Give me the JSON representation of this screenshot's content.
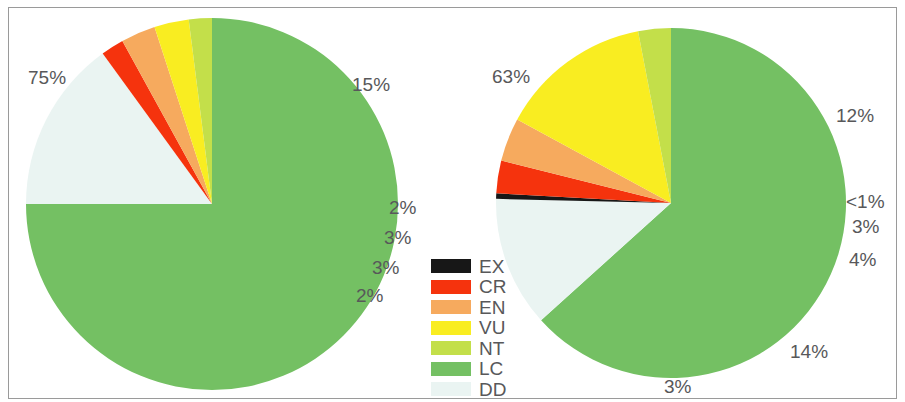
{
  "figure": {
    "background_color": "#ffffff",
    "frame_color": "#9a9a9a",
    "label_color": "#58585a"
  },
  "legend": {
    "name": "iucn-red-list-categories",
    "items": [
      {
        "code": "EX",
        "color": "#171717"
      },
      {
        "code": "CR",
        "color": "#f5330d"
      },
      {
        "code": "EN",
        "color": "#f6aa5e"
      },
      {
        "code": "VU",
        "color": "#f9ed21"
      },
      {
        "code": "NT",
        "color": "#c3df4a"
      },
      {
        "code": "LC",
        "color": "#74c063"
      },
      {
        "code": "DD",
        "color": "#eaf4f2"
      }
    ]
  },
  "chart_data": [
    {
      "type": "pie",
      "name": "left-pie",
      "title": "",
      "categories": [
        "LC",
        "DD",
        "EX",
        "CR",
        "EN",
        "VU",
        "NT"
      ],
      "labels": [
        "75%",
        "15%",
        "",
        "2%",
        "3%",
        "3%",
        "2%"
      ],
      "values": [
        75,
        15,
        0,
        2,
        3,
        3,
        2
      ],
      "colors": [
        "#74c063",
        "#eaf4f2",
        "#171717",
        "#f5330d",
        "#f6aa5e",
        "#f9ed21",
        "#c3df4a"
      ],
      "legend_position": "center-between-charts",
      "start_angle_deg": -90,
      "exploded": false
    },
    {
      "type": "pie",
      "name": "right-pie",
      "title": "",
      "categories": [
        "LC",
        "DD",
        "EX",
        "CR",
        "EN",
        "VU",
        "NT"
      ],
      "labels": [
        "63%",
        "12%",
        "<1%",
        "3%",
        "4%",
        "14%",
        "3%"
      ],
      "values": [
        63,
        12,
        0.5,
        3,
        4,
        14,
        3
      ],
      "colors": [
        "#74c063",
        "#eaf4f2",
        "#171717",
        "#f5330d",
        "#f6aa5e",
        "#f9ed21",
        "#c3df4a"
      ],
      "legend_position": "center-between-charts",
      "start_angle_deg": -90,
      "exploded": false
    }
  ],
  "left_chart": {
    "center_x": 212,
    "center_y": 204,
    "radius": 186,
    "labels": {
      "lc": {
        "text": "75%",
        "x": 28,
        "y": 67
      },
      "dd": {
        "text": "15%",
        "x": 352,
        "y": 74
      },
      "cr": {
        "text": "2%",
        "x": 389,
        "y": 197
      },
      "en": {
        "text": "3%",
        "x": 384,
        "y": 227
      },
      "vu": {
        "text": "3%",
        "x": 372,
        "y": 257
      },
      "nt": {
        "text": "2%",
        "x": 356,
        "y": 285
      }
    }
  },
  "right_chart": {
    "center_x": 671,
    "center_y": 203,
    "radius": 175,
    "labels": {
      "lc": {
        "text": "63%",
        "x": 492,
        "y": 66
      },
      "dd": {
        "text": "12%",
        "x": 836,
        "y": 105
      },
      "ex": {
        "text": "<1%",
        "x": 846,
        "y": 191
      },
      "cr": {
        "text": "3%",
        "x": 852,
        "y": 216
      },
      "en": {
        "text": "4%",
        "x": 849,
        "y": 249
      },
      "vu": {
        "text": "14%",
        "x": 790,
        "y": 341
      },
      "nt": {
        "text": "3%",
        "x": 664,
        "y": 376
      }
    }
  }
}
